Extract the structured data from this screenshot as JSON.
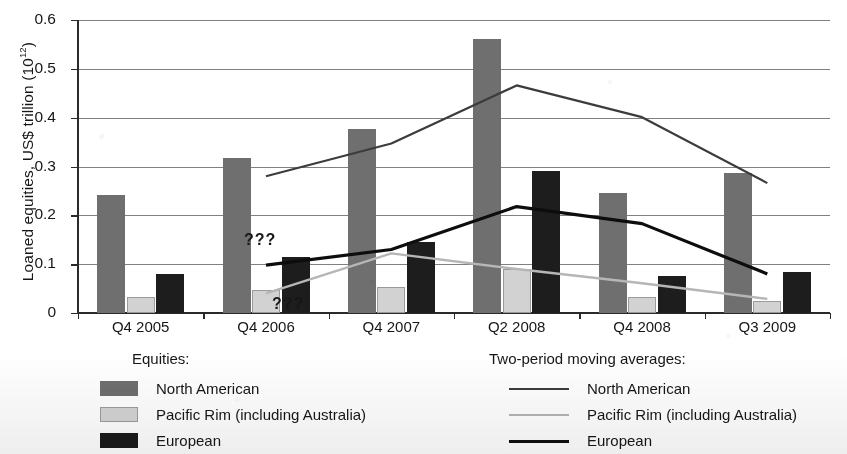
{
  "chart_data": {
    "type": "bar",
    "title": "",
    "xlabel": "",
    "ylabel": "Loaned equities, US$ trillion (10",
    "ylabel_exponent": "12",
    "ylabel_close": ")",
    "ylim": [
      0,
      0.6
    ],
    "ytick_labels": [
      "0.6",
      "0.5",
      "0.4",
      "0.3",
      "0.2",
      "0.1",
      "0"
    ],
    "ytick_values": [
      0.6,
      0.5,
      0.4,
      0.3,
      0.2,
      0.1,
      0
    ],
    "grid": true,
    "legend_position": "below-plot",
    "categories": [
      "Q4 2005",
      "Q4 2006",
      "Q4 2007",
      "Q2 2008",
      "Q4 2008",
      "Q3 2009"
    ],
    "series": [
      {
        "name": "North American",
        "kind": "bar",
        "color": "#6f6f6f",
        "values": [
          0.241,
          0.317,
          0.377,
          0.562,
          0.245,
          0.287
        ]
      },
      {
        "name": "Pacific Rim (including Australia)",
        "kind": "bar",
        "color": "#d2d2d2",
        "values": [
          0.033,
          0.047,
          0.053,
          0.09,
          0.032,
          0.025
        ]
      },
      {
        "name": "European",
        "kind": "bar",
        "color": "#1d1d1d",
        "values": [
          0.08,
          0.115,
          0.145,
          0.29,
          0.075,
          0.085
        ]
      },
      {
        "name": "North American",
        "kind": "line",
        "color": "#3c3c3c",
        "values": [
          null,
          0.28,
          0.347,
          0.466,
          0.401,
          0.266
        ]
      },
      {
        "name": "Pacific Rim (including Australia)",
        "kind": "line",
        "color": "#b6b6b6",
        "values": [
          null,
          0.04,
          0.122,
          0.09,
          0.061,
          0.029
        ]
      },
      {
        "name": "European",
        "kind": "line",
        "color": "#0d0d0d",
        "values": [
          null,
          0.098,
          0.13,
          0.218,
          0.183,
          0.08
        ]
      }
    ],
    "annotations": [
      {
        "text": "???",
        "target": "european-moving-average",
        "x_category": "Q4 2006"
      },
      {
        "text": "???",
        "target": "pacific-rim-moving-average",
        "x_category": "Q4 2006"
      }
    ]
  },
  "legend_equities": {
    "heading": "Equities:",
    "items": [
      {
        "label": "North American"
      },
      {
        "label": "Pacific Rim (including Australia)"
      },
      {
        "label": "European"
      }
    ]
  },
  "legend_averages": {
    "heading": "Two-period moving averages:",
    "items": [
      {
        "label": "North American"
      },
      {
        "label": "Pacific Rim (including Australia)"
      },
      {
        "label": "European"
      }
    ]
  }
}
